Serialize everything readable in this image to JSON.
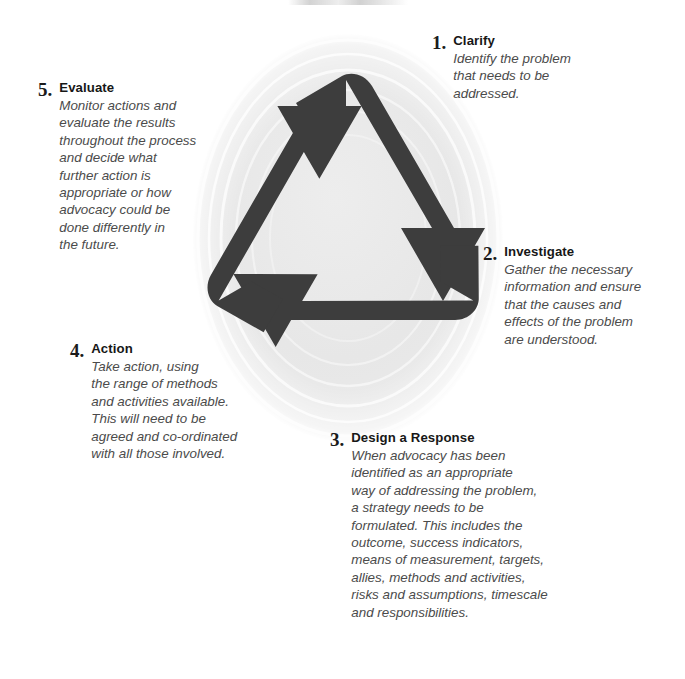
{
  "diagram": {
    "graphic": {
      "name": "recycling-arrows",
      "arrow_color": "#3d3d3d",
      "disc_color": "#e8e8e8",
      "ring_color": "#f7f7f7",
      "arrow_count": 3,
      "direction": "clockwise"
    },
    "steps": [
      {
        "number": "1.",
        "title": "Clarify",
        "text": "Identify the problem\nthat needs to be\naddressed."
      },
      {
        "number": "2.",
        "title": "Investigate",
        "text": "Gather the necessary\ninformation and ensure\nthat the causes and\neffects of the problem\nare understood."
      },
      {
        "number": "3.",
        "title": "Design a Response",
        "text": "When advocacy has been\nidentified as an appropriate\nway of addressing the problem,\na strategy needs to be\nformulated. This includes the\noutcome, success indicators,\nmeans of measurement, targets,\nallies, methods and activities,\nrisks and assumptions, timescale\nand responsibilities."
      },
      {
        "number": "4.",
        "title": "Action",
        "text": "Take action, using\nthe range of methods\nand activities available.\nThis will need to be\nagreed and co-ordinated\nwith all those involved."
      },
      {
        "number": "5.",
        "title": "Evaluate",
        "text": "Monitor actions and\nevaluate the results\nthroughout the process\nand decide what\nfurther action is\nappropriate or how\nadvocacy could be\ndone differently in\nthe future."
      }
    ]
  }
}
